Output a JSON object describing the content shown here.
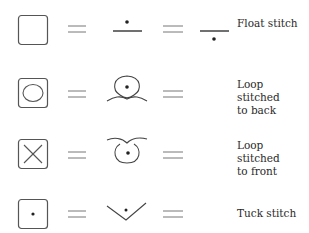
{
  "legend": {
    "title": "",
    "rows": [
      {
        "box_symbol": "empty-square",
        "glyphs": [
          "dot-above-line",
          "dot-below-line"
        ],
        "label_lines": [
          "Float stitch"
        ]
      },
      {
        "box_symbol": "square-with-ellipse",
        "glyphs": [
          "loop-with-dot-back"
        ],
        "label_lines": [
          "Loop stitched",
          "to back"
        ]
      },
      {
        "box_symbol": "square-with-x",
        "glyphs": [
          "loop-with-dot-front"
        ],
        "label_lines": [
          "Loop stitched",
          "to front"
        ]
      },
      {
        "box_symbol": "square-with-dot",
        "glyphs": [
          "v-with-dot"
        ],
        "label_lines": [
          "Tuck stitch"
        ]
      }
    ]
  },
  "colors": {
    "stroke": "#555555",
    "text": "#2a2a2a",
    "background": "#ffffff"
  }
}
